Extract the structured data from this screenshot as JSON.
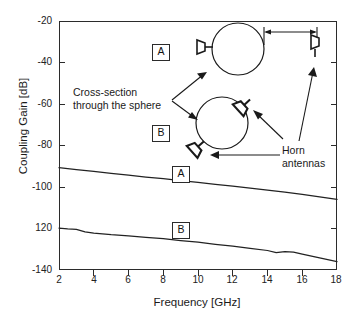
{
  "figure": {
    "background": "#ffffff",
    "line_color": "#222222"
  },
  "axes": {
    "y_title": "Coupling Gain  [dB]",
    "x_title": "Frequency  [GHz]",
    "y_ticks": [
      "-20",
      "-40",
      "-60",
      "-80",
      "-100",
      "120",
      "-140"
    ],
    "x_ticks": [
      "2",
      "4",
      "6",
      "8",
      "10",
      "12",
      "14",
      "16",
      "18"
    ]
  },
  "legend_keys": {
    "curve_a_key": "A",
    "curve_b_key": "B",
    "inset_a_key": "A",
    "inset_b_key": "B"
  },
  "annotations": {
    "cross_section_line1": "Cross-section",
    "cross_section_line2": "through the sphere",
    "horn_line1": "Horn",
    "horn_line2": "antennas"
  },
  "chart_data": {
    "type": "line",
    "title": "",
    "xlabel": "Frequency  [GHz]",
    "ylabel": "Coupling Gain  [dB]",
    "xlim": [
      2,
      18
    ],
    "ylim": [
      -140,
      -20
    ],
    "xticks": [
      2,
      4,
      6,
      8,
      10,
      12,
      14,
      16,
      18
    ],
    "yticks": [
      -20,
      -40,
      -60,
      -80,
      -100,
      -120,
      -140
    ],
    "grid": false,
    "legend_position": "inline-boxed-labels",
    "series": [
      {
        "name": "A",
        "label": "A",
        "comment": "sphere with one adjacent horn and one separated horn",
        "x": [
          2,
          3,
          4,
          5,
          6,
          7,
          8,
          9,
          10,
          11,
          12,
          13,
          14,
          15,
          16,
          17,
          18
        ],
        "values": [
          -90.7,
          -91.6,
          -92.5,
          -93.4,
          -94.3,
          -95.2,
          -96.0,
          -96.9,
          -97.8,
          -98.7,
          -99.6,
          -100.5,
          -101.5,
          -102.5,
          -103.6,
          -104.8,
          -106.0
        ]
      },
      {
        "name": "B",
        "label": "B",
        "comment": "sphere with two tangential horns",
        "x": [
          2,
          2.5,
          3,
          3.5,
          4,
          5,
          6,
          7,
          8,
          9,
          10,
          11,
          12,
          13,
          14,
          14.5,
          15,
          15.5,
          16,
          17,
          18
        ],
        "values": [
          -119.8,
          -120.2,
          -120.4,
          -121.6,
          -122.2,
          -123.0,
          -123.6,
          -124.3,
          -124.9,
          -125.8,
          -126.6,
          -127.6,
          -128.5,
          -129.6,
          -130.6,
          -131.6,
          -131.2,
          -131.4,
          -132.3,
          -134.2,
          -136.0
        ]
      }
    ]
  },
  "inset": {
    "config_a": {
      "key": "A",
      "sphere": "cross-section-circle",
      "horn_near": "horn-antenna-touching-sphere",
      "horn_far": "horn-antenna-separated",
      "separation_arrow": "double-headed-dimension-arrow"
    },
    "config_b": {
      "key": "B",
      "sphere": "cross-section-circle",
      "horn_upper": "horn-antenna-tangential-upper-right",
      "horn_lower": "horn-antenna-tangential-lower-left"
    }
  }
}
